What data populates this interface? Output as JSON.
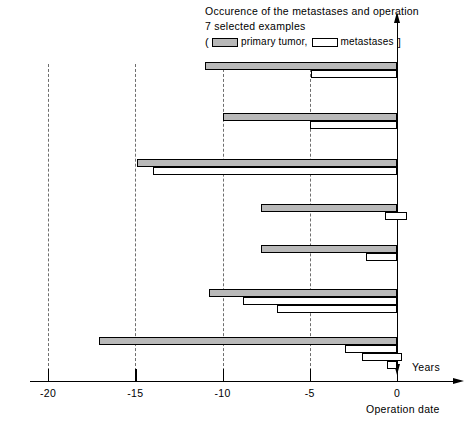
{
  "title": {
    "line1": "Occurence of the metastases and operation",
    "line2": "7 selected examples"
  },
  "legend": {
    "open_paren": "(",
    "close_paren": "]",
    "primary_label": "primary  tumor,",
    "metastases_label": "metastases",
    "primary_swatch": "filled-bar-swatch",
    "metastases_swatch": "hollow-bar-swatch",
    "primary_color": "#b9b9b9",
    "metastases_color": "#ffffff"
  },
  "axis": {
    "unit_label": "Years",
    "origin_label": "Operation date",
    "ticks": [
      "-20",
      "-15",
      "-10",
      "-5",
      "0"
    ],
    "tick_values": [
      -20,
      -15,
      -10,
      -5,
      0
    ]
  },
  "chart_data": {
    "type": "bar",
    "orientation": "horizontal",
    "title": "Occurence of the metastases and operation",
    "subtitle": "7 selected examples",
    "xlabel": "Years",
    "ylabel": "",
    "xlim": [
      -21.5,
      1.5
    ],
    "grid": true,
    "grid_axis": "x",
    "legend": [
      "primary tumor",
      "metastases"
    ],
    "legend_position": "top",
    "note": "Each bar spans from onset (left end) to the operation date at year 0. Values are in years relative to the operation date.",
    "patients": [
      {
        "id": 1,
        "primary_tumor": {
          "start": -11.0,
          "end": 0.0
        },
        "metastases": [
          {
            "start": -4.9,
            "end": 0.0
          }
        ]
      },
      {
        "id": 2,
        "primary_tumor": {
          "start": -10.0,
          "end": 0.0
        },
        "metastases": [
          {
            "start": -5.0,
            "end": 0.0
          }
        ]
      },
      {
        "id": 3,
        "primary_tumor": {
          "start": -14.9,
          "end": 0.0
        },
        "metastases": [
          {
            "start": -14.0,
            "end": 0.0
          }
        ]
      },
      {
        "id": 4,
        "primary_tumor": {
          "start": -7.8,
          "end": 0.0
        },
        "metastases": [
          {
            "start": -0.7,
            "end": 0.6
          }
        ]
      },
      {
        "id": 5,
        "primary_tumor": {
          "start": -7.8,
          "end": 0.0
        },
        "metastases": [
          {
            "start": -1.8,
            "end": 0.0
          }
        ]
      },
      {
        "id": 6,
        "primary_tumor": {
          "start": -10.8,
          "end": 0.0
        },
        "metastases": [
          {
            "start": -8.8,
            "end": 0.0
          },
          {
            "start": -6.9,
            "end": 0.0
          }
        ]
      },
      {
        "id": 7,
        "primary_tumor": {
          "start": -17.1,
          "end": 0.0
        },
        "metastases": [
          {
            "start": -3.0,
            "end": 0.0
          },
          {
            "start": -2.0,
            "end": 0.3
          },
          {
            "start": -0.6,
            "end": 0.0
          }
        ]
      }
    ]
  }
}
